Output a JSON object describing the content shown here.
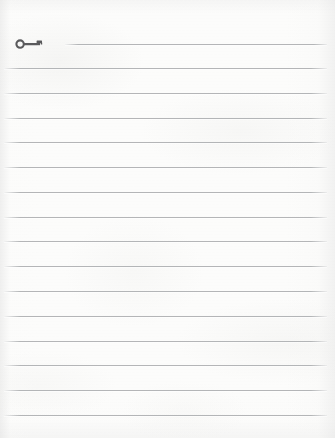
{
  "document": {
    "type": "scanned-lined-paper",
    "page_width": 335,
    "page_height": 438,
    "background_color": "#fcfcfb",
    "rule_color": "#aeb0b2",
    "ink_color": "#5a5a5c",
    "text_content": "",
    "visible_text": []
  },
  "ruled_lines": {
    "count": 16,
    "spacing_px": 24.7,
    "first_line_y": 44,
    "last_line_y": 415,
    "left_x": 4,
    "right_x": 327,
    "lines": [
      {
        "y": 44,
        "x": 65,
        "width": 262,
        "note": "first rule, interrupted by key doodle at left"
      },
      {
        "y": 68,
        "x": 4,
        "width": 323
      },
      {
        "y": 93,
        "x": 4,
        "width": 323
      },
      {
        "y": 118,
        "x": 4,
        "width": 323
      },
      {
        "y": 142,
        "x": 4,
        "width": 323
      },
      {
        "y": 167,
        "x": 4,
        "width": 323
      },
      {
        "y": 192,
        "x": 4,
        "width": 323
      },
      {
        "y": 217,
        "x": 4,
        "width": 323
      },
      {
        "y": 241,
        "x": 4,
        "width": 323
      },
      {
        "y": 266,
        "x": 4,
        "width": 323
      },
      {
        "y": 291,
        "x": 4,
        "width": 323
      },
      {
        "y": 316,
        "x": 4,
        "width": 323
      },
      {
        "y": 341,
        "x": 4,
        "width": 323
      },
      {
        "y": 365,
        "x": 4,
        "width": 323
      },
      {
        "y": 390,
        "x": 4,
        "width": 323
      },
      {
        "y": 415,
        "x": 4,
        "width": 323
      }
    ]
  },
  "annotations": {
    "key_doodle": {
      "icon": "key-icon",
      "description": "small dark gray key drawing with round bow on left, shaft, and bit teeth at right",
      "x": 15,
      "y": 37,
      "width": 30,
      "height": 14,
      "color": "#5a5a5c"
    }
  },
  "margins": {
    "top_blank_px": 44,
    "bottom_blank_px": 23
  }
}
